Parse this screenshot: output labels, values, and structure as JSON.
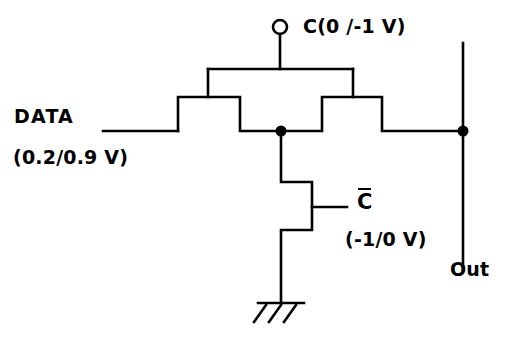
{
  "figure": {
    "kind": "circuit-schematic",
    "background_color": "#ffffff",
    "line_color": "#000000",
    "stroke_width": 2.6
  },
  "labels": {
    "data": "DATA",
    "data_voltage": "(0.2/0.9 V)",
    "clock": "C(0 /-1 V)",
    "clock_bar": "C",
    "clock_bar_voltage": "(-1/0 V)",
    "out": "Out"
  },
  "nodes": {
    "clock_terminal": {
      "name": "open-circle-terminal",
      "x": 280,
      "y": 27,
      "radius": 7
    },
    "internal_junction": {
      "name": "junction-dot",
      "x": 281,
      "y": 131,
      "radius": 5.5
    },
    "output_junction": {
      "name": "junction-dot",
      "x": 463,
      "y": 131,
      "radius": 5.5
    }
  },
  "wires": {
    "data_input": {
      "from_x": 103,
      "to_x": 178,
      "y": 131
    },
    "output_rail": {
      "x": 463,
      "from_y": 43,
      "to_y": 270
    },
    "output_connect": {
      "from_x": 382,
      "to_x": 463,
      "y": 131
    },
    "clock_stem": {
      "x": 280,
      "from_y": 34,
      "to_y": 69
    },
    "clock_bus": {
      "y": 69,
      "from_x": 208,
      "to_x": 353
    },
    "gate_drop_left": {
      "x": 208,
      "from_y": 69,
      "to_y": 97
    },
    "gate_drop_right": {
      "x": 353,
      "from_y": 69,
      "to_y": 97
    },
    "gate_bar_left": {
      "y": 97,
      "from_x": 178,
      "to_x": 240
    },
    "gate_bar_right": {
      "y": 97,
      "from_x": 322,
      "to_x": 382
    },
    "pulldown_stem": {
      "x": 281,
      "from_y": 131,
      "to_y": 182
    },
    "pulldown_gate_stub": {
      "y": 207,
      "from_x": 312,
      "to_x": 347
    },
    "ground_stem": {
      "x": 281,
      "from_y": 230,
      "to_y": 303
    },
    "ground_bar": {
      "y": 303,
      "from_x": 258,
      "to_x": 304
    }
  },
  "ground_symbol": {
    "name": "earth-ground-hatched",
    "hatch_count": 3
  }
}
